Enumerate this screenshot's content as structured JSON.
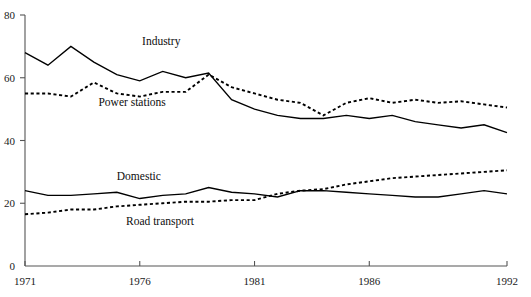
{
  "chart_data": {
    "type": "line",
    "title": "",
    "subtitle": "",
    "xlabel": "",
    "ylabel": "",
    "xlim": [
      1971,
      1992
    ],
    "ylim": [
      0,
      80
    ],
    "grid": false,
    "legend": "inline-annotations",
    "x": [
      1971,
      1972,
      1973,
      1974,
      1975,
      1976,
      1977,
      1978,
      1979,
      1980,
      1981,
      1982,
      1983,
      1984,
      1985,
      1986,
      1987,
      1988,
      1989,
      1990,
      1991,
      1992
    ],
    "xticks": [
      1971,
      1976,
      1981,
      1986,
      1992
    ],
    "xtick_labels": [
      "1971",
      "1976",
      "1981",
      "1986",
      "1992"
    ],
    "yticks": [
      0,
      20,
      40,
      60,
      80
    ],
    "ytick_labels": [
      "0",
      "20",
      "40",
      "60",
      "80"
    ],
    "series": [
      {
        "name": "Industry",
        "style": "solid",
        "color": "#000000",
        "label_x": 1976.1,
        "label_y": 70.5,
        "values": [
          68,
          64,
          70,
          65,
          61,
          59,
          62,
          60,
          61.5,
          53,
          50,
          48,
          47,
          47,
          48,
          47,
          48,
          46,
          45,
          44,
          45,
          42.5
        ]
      },
      {
        "name": "Power stations",
        "style": "dotted",
        "color": "#000000",
        "label_x": 1974.2,
        "label_y": 51.0,
        "values": [
          55,
          55,
          54,
          58.5,
          55,
          54,
          55.5,
          55.5,
          61,
          57,
          55,
          53,
          52,
          48,
          52,
          53.5,
          52,
          53,
          52,
          52.5,
          51.5,
          50.5
        ]
      },
      {
        "name": "Domestic",
        "style": "solid",
        "color": "#000000",
        "label_x": 1975.0,
        "label_y": 27.5,
        "values": [
          24,
          22.5,
          22.5,
          23,
          23.5,
          21.5,
          22.5,
          23,
          25,
          23.5,
          23,
          22,
          24,
          24,
          23.5,
          23,
          22.5,
          22,
          22,
          23,
          24,
          23
        ]
      },
      {
        "name": "Road transport",
        "style": "dotted",
        "color": "#000000",
        "label_x": 1975.4,
        "label_y": 13.0,
        "values": [
          16.5,
          17,
          18,
          18,
          19,
          19.5,
          20,
          20.5,
          20.5,
          21,
          21,
          23,
          24,
          24.5,
          26,
          27,
          28,
          28.5,
          29,
          29.5,
          30,
          30.5
        ]
      }
    ]
  },
  "figure": {
    "background_color": "#ffffff",
    "axis_color": "#555555",
    "text_color": "#1a1a1a"
  }
}
